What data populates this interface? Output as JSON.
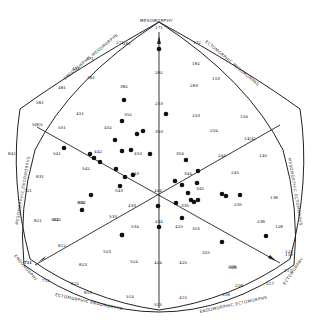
{
  "chart_data": {
    "type": "scatter",
    "axis_labels": {
      "top": "MESOMORPHY",
      "upper_left": "ENDOMORPHIC MESOMORPHS",
      "upper_right": "ECTOMORPHIC MESOMORPHS",
      "left": "MESOMORPHIC ENDOMORPHS",
      "right": "MESOMORPHIC ECTOMORPHS",
      "lower_left_corner": "ENDOMORPHY",
      "lower_right_corner": "ECTOMORPHY",
      "bottom_left": "ECTOMORPHIC ENDOMORPHS",
      "bottom_right": "ENDOMORPHIC ECTOMORPHS"
    },
    "somatotype_labels": [
      {
        "t": "171",
        "x": 159,
        "y": 27
      },
      {
        "t": "271",
        "x": 120,
        "y": 42
      },
      {
        "t": "172",
        "x": 197,
        "y": 42
      },
      {
        "t": "371",
        "x": 90,
        "y": 58
      },
      {
        "t": "261",
        "x": 127,
        "y": 43
      },
      {
        "t": "262",
        "x": 159,
        "y": 72
      },
      {
        "t": "471",
        "x": 76,
        "y": 68
      },
      {
        "t": "361",
        "x": 91,
        "y": 77
      },
      {
        "t": "362",
        "x": 124,
        "y": 86
      },
      {
        "t": "162",
        "x": 196,
        "y": 63
      },
      {
        "t": "263",
        "x": 194,
        "y": 85
      },
      {
        "t": "153",
        "x": 216,
        "y": 78
      },
      {
        "t": "461",
        "x": 62,
        "y": 87
      },
      {
        "t": "561",
        "x": 40,
        "y": 102
      },
      {
        "t": "451",
        "x": 80,
        "y": 113
      },
      {
        "t": "352",
        "x": 128,
        "y": 114
      },
      {
        "t": "253",
        "x": 159,
        "y": 103
      },
      {
        "t": "253",
        "x": 196,
        "y": 115
      },
      {
        "t": "154",
        "x": 244,
        "y": 116
      },
      {
        "t": "5(6)1",
        "x": 36,
        "y": 124
      },
      {
        "t": "551",
        "x": 62,
        "y": 127
      },
      {
        "t": "452",
        "x": 108,
        "y": 127
      },
      {
        "t": "353",
        "x": 159,
        "y": 131
      },
      {
        "t": "254",
        "x": 214,
        "y": 130
      },
      {
        "t": "641",
        "x": 12,
        "y": 153
      },
      {
        "t": "541",
        "x": 57,
        "y": 153
      },
      {
        "t": "442",
        "x": 98,
        "y": 151
      },
      {
        "t": "453",
        "x": 138,
        "y": 153
      },
      {
        "t": "354",
        "x": 180,
        "y": 153
      },
      {
        "t": "244",
        "x": 222,
        "y": 155
      },
      {
        "t": "14(4)",
        "x": 248,
        "y": 138
      },
      {
        "t": "145",
        "x": 263,
        "y": 155
      },
      {
        "t": "542",
        "x": 86,
        "y": 168
      },
      {
        "t": "443",
        "x": 135,
        "y": 173
      },
      {
        "t": "344",
        "x": 188,
        "y": 173
      },
      {
        "t": "543",
        "x": 119,
        "y": 190
      },
      {
        "t": "444",
        "x": 158,
        "y": 190
      },
      {
        "t": "345",
        "x": 200,
        "y": 188
      },
      {
        "t": "245",
        "x": 235,
        "y": 172
      },
      {
        "t": "631",
        "x": 40,
        "y": 176
      },
      {
        "t": "632",
        "x": 82,
        "y": 202
      },
      {
        "t": "532",
        "x": 81,
        "y": 202
      },
      {
        "t": "433",
        "x": 132,
        "y": 205
      },
      {
        "t": "335",
        "x": 185,
        "y": 205
      },
      {
        "t": "235",
        "x": 238,
        "y": 204
      },
      {
        "t": "136",
        "x": 274,
        "y": 197
      },
      {
        "t": "721",
        "x": 28,
        "y": 190
      },
      {
        "t": "522",
        "x": 55,
        "y": 219
      },
      {
        "t": "621",
        "x": 38,
        "y": 220
      },
      {
        "t": "632",
        "x": 57,
        "y": 219
      },
      {
        "t": "533",
        "x": 113,
        "y": 216
      },
      {
        "t": "434",
        "x": 159,
        "y": 221
      },
      {
        "t": "325",
        "x": 196,
        "y": 228
      },
      {
        "t": "236",
        "x": 261,
        "y": 221
      },
      {
        "t": "126",
        "x": 279,
        "y": 226
      },
      {
        "t": "534",
        "x": 135,
        "y": 226
      },
      {
        "t": "425",
        "x": 179,
        "y": 226
      },
      {
        "t": "711",
        "x": 28,
        "y": 262
      },
      {
        "t": "612",
        "x": 62,
        "y": 245
      },
      {
        "t": "523",
        "x": 107,
        "y": 251
      },
      {
        "t": "424",
        "x": 158,
        "y": 262
      },
      {
        "t": "325",
        "x": 206,
        "y": 252
      },
      {
        "t": "226",
        "x": 232,
        "y": 266
      },
      {
        "t": "125",
        "x": 289,
        "y": 251
      },
      {
        "t": "623",
        "x": 83,
        "y": 264
      },
      {
        "t": "524",
        "x": 134,
        "y": 261
      },
      {
        "t": "425",
        "x": 183,
        "y": 262
      },
      {
        "t": "326",
        "x": 233,
        "y": 267
      },
      {
        "t": "711",
        "x": 28,
        "y": 262
      },
      {
        "t": "712",
        "x": 46,
        "y": 280
      },
      {
        "t": "622",
        "x": 75,
        "y": 283
      },
      {
        "t": "613",
        "x": 88,
        "y": 292
      },
      {
        "t": "514",
        "x": 130,
        "y": 296
      },
      {
        "t": "515",
        "x": 158,
        "y": 304
      },
      {
        "t": "415",
        "x": 183,
        "y": 297
      },
      {
        "t": "316",
        "x": 226,
        "y": 294
      },
      {
        "t": "216",
        "x": 239,
        "y": 285
      },
      {
        "t": "217",
        "x": 270,
        "y": 283
      },
      {
        "t": "117",
        "x": 288,
        "y": 270
      },
      {
        "t": "116",
        "x": 289,
        "y": 254
      }
    ],
    "points": [
      {
        "x": 159,
        "y": 49
      },
      {
        "x": 124,
        "y": 100
      },
      {
        "x": 166,
        "y": 114
      },
      {
        "x": 122,
        "y": 121
      },
      {
        "x": 143,
        "y": 131
      },
      {
        "x": 137,
        "y": 134
      },
      {
        "x": 122,
        "y": 151
      },
      {
        "x": 125,
        "y": 177
      },
      {
        "x": 150,
        "y": 154
      },
      {
        "x": 100,
        "y": 162
      },
      {
        "x": 115,
        "y": 140
      },
      {
        "x": 90,
        "y": 154
      },
      {
        "x": 133,
        "y": 175
      },
      {
        "x": 120,
        "y": 186
      },
      {
        "x": 116,
        "y": 169
      },
      {
        "x": 131,
        "y": 150
      },
      {
        "x": 94,
        "y": 158
      },
      {
        "x": 186,
        "y": 160
      },
      {
        "x": 175,
        "y": 181
      },
      {
        "x": 182,
        "y": 185
      },
      {
        "x": 197,
        "y": 183
      },
      {
        "x": 198,
        "y": 171
      },
      {
        "x": 188,
        "y": 193
      },
      {
        "x": 176,
        "y": 203
      },
      {
        "x": 194,
        "y": 202
      },
      {
        "x": 191,
        "y": 200
      },
      {
        "x": 198,
        "y": 200
      },
      {
        "x": 222,
        "y": 194
      },
      {
        "x": 226,
        "y": 196
      },
      {
        "x": 158,
        "y": 206
      },
      {
        "x": 159,
        "y": 227
      },
      {
        "x": 182,
        "y": 218
      },
      {
        "x": 240,
        "y": 195
      },
      {
        "x": 222,
        "y": 242
      },
      {
        "x": 122,
        "y": 235
      },
      {
        "x": 122,
        "y": 235
      },
      {
        "x": 82,
        "y": 210
      },
      {
        "x": 91,
        "y": 195
      },
      {
        "x": 64,
        "y": 148
      },
      {
        "x": 266,
        "y": 236
      }
    ],
    "grid": false
  }
}
